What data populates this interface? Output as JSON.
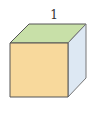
{
  "diagram": {
    "type": "cube",
    "edge_label": "1",
    "colors": {
      "front_face": "#f8d99c",
      "top_face": "#c8e0a8",
      "right_face": "#dde8f3",
      "edge": "#555555",
      "background": "#ffffff"
    }
  }
}
